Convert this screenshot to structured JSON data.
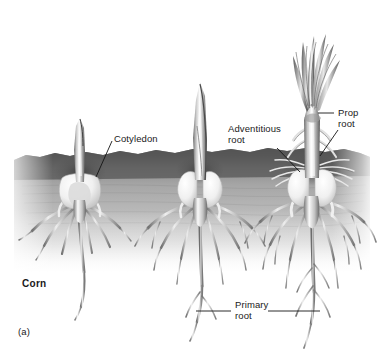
{
  "figure": {
    "panel_label": "(a)",
    "plant_name": "Corn",
    "background_color": "#ffffff",
    "soil": {
      "crust_color": "#5d5d5d",
      "mid_color": "#a8a8a8",
      "deep_color": "#d8d8d8",
      "top_y": 152,
      "bottom_y": 268
    },
    "plant_color_light": "#f2f2f2",
    "plant_color_mid": "#9a9a9a",
    "plant_color_dark": "#4a4a4a",
    "leader_line_color": "#1a1a1a"
  },
  "labels": {
    "cotyledon": "Cotyledon",
    "adventitious_root": "Adventitious\nroot",
    "prop_root": "Prop\nroot",
    "primary_root": "Primary\nroot"
  },
  "stages": [
    {
      "name": "stage-1-early-seedling",
      "center_x": 78,
      "has_cotyledon_label": true
    },
    {
      "name": "stage-2-mid-seedling",
      "center_x": 200,
      "has_cotyledon_label": false
    },
    {
      "name": "stage-3-mature-seedling",
      "center_x": 312,
      "has_cotyledon_label": false
    }
  ]
}
